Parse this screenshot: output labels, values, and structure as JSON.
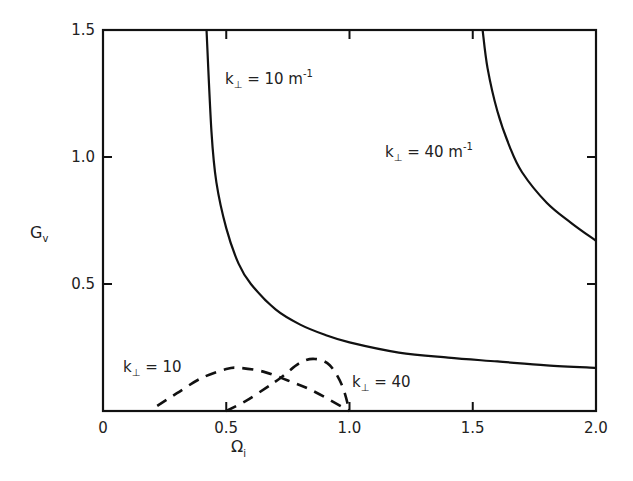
{
  "chart_data": {
    "type": "line",
    "title": "",
    "xlabel": "Ω_i",
    "ylabel": "G_v",
    "xlim": [
      0,
      2.0
    ],
    "ylim": [
      0,
      1.5
    ],
    "xticks": [
      "0",
      "0.5",
      "1.0",
      "1.5",
      "2.0"
    ],
    "yticks": [
      "0.5",
      "1.0",
      "1.5"
    ],
    "grid": false,
    "legend": "none (inline annotations)",
    "series": [
      {
        "name": "k⊥ = 10 m⁻¹ (solid)",
        "style": "solid",
        "x": [
          0.42,
          0.44,
          0.46,
          0.5,
          0.55,
          0.6,
          0.7,
          0.8,
          0.9,
          1.0,
          1.2,
          1.4,
          1.6,
          1.8,
          2.0
        ],
        "y": [
          1.5,
          1.1,
          0.9,
          0.72,
          0.58,
          0.5,
          0.4,
          0.34,
          0.3,
          0.27,
          0.23,
          0.21,
          0.195,
          0.18,
          0.17
        ]
      },
      {
        "name": "k⊥ = 40 m⁻¹ (solid)",
        "style": "solid",
        "x": [
          1.54,
          1.56,
          1.6,
          1.65,
          1.7,
          1.8,
          1.9,
          2.0
        ],
        "y": [
          1.5,
          1.35,
          1.18,
          1.04,
          0.94,
          0.82,
          0.74,
          0.67
        ]
      },
      {
        "name": "k⊥ = 10 (dashed)",
        "style": "dashed",
        "x": [
          0.22,
          0.3,
          0.4,
          0.5,
          0.55,
          0.65,
          0.75,
          0.85,
          1.0
        ],
        "y": [
          0.02,
          0.07,
          0.13,
          0.165,
          0.17,
          0.155,
          0.12,
          0.08,
          0.0
        ]
      },
      {
        "name": "k⊥ = 40 (dashed)",
        "style": "dashed",
        "x": [
          0.5,
          0.58,
          0.66,
          0.72,
          0.8,
          0.86,
          0.92,
          0.97,
          1.0
        ],
        "y": [
          0.0,
          0.04,
          0.09,
          0.13,
          0.19,
          0.205,
          0.18,
          0.1,
          0.0
        ]
      }
    ],
    "annotations": [
      {
        "text": "k⊥ = 10 m⁻¹",
        "x": 0.57,
        "y": 1.35
      },
      {
        "text": "k⊥ = 40 m⁻¹",
        "x": 1.17,
        "y": 1.0
      },
      {
        "text": "k⊥ = 10",
        "x": 0.12,
        "y": 0.2
      },
      {
        "text": "k⊥ = 40",
        "x": 1.04,
        "y": 0.11
      }
    ]
  },
  "labels": {
    "xlabel_main": "Ω",
    "xlabel_sub": "i",
    "ylabel_main": "G",
    "ylabel_sub": "v",
    "k": "k",
    "perp": "⊥",
    "ann1_rest": " = 10  m",
    "ann1_exp": "-1",
    "ann2_rest": " = 40  m",
    "ann2_exp": "-1",
    "ann3_rest": " = 10",
    "ann4_rest": " = 40"
  }
}
